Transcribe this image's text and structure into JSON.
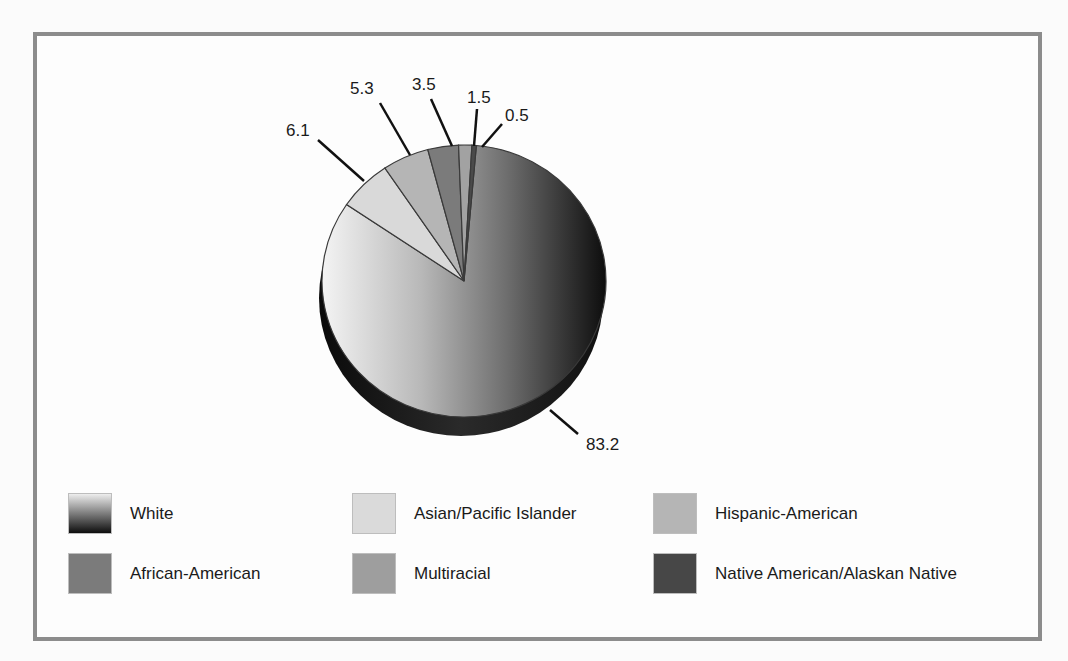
{
  "chart_data": {
    "type": "pie",
    "title": "",
    "style": "3d-tilted pie with leader-line labels, grayscale",
    "start_angle_deg": 5,
    "direction": "clockwise",
    "slices": [
      {
        "name": "White",
        "value": 83.2,
        "label": "83.2",
        "color": "gradient:#f2f2f2->#0d0d0d"
      },
      {
        "name": "Asian/Pacific Islander",
        "value": 6.1,
        "label": "6.1",
        "color": "#d9d9d9"
      },
      {
        "name": "Hispanic-American",
        "value": 5.3,
        "label": "5.3",
        "color": "#b5b5b5"
      },
      {
        "name": "African-American",
        "value": 3.5,
        "label": "3.5",
        "color": "#7b7b7b"
      },
      {
        "name": "Multiracial",
        "value": 1.5,
        "label": "1.5",
        "color": "#a2a2a2"
      },
      {
        "name": "Native American/Alaskan Native",
        "value": 0.5,
        "label": "0.5",
        "color": "#4a4a4a"
      }
    ],
    "legend_position": "bottom",
    "legend": [
      "White",
      "Asian/Pacific Islander",
      "Hispanic-American",
      "African-American",
      "Multiracial",
      "Native American/Alaskan Native"
    ]
  },
  "labels": {
    "white": "83.2",
    "asian": "6.1",
    "hispanic": "5.3",
    "african": "3.5",
    "multiracial": "1.5",
    "native": "0.5"
  },
  "legend": {
    "white": "White",
    "asian": "Asian/Pacific Islander",
    "hispanic": "Hispanic-American",
    "african": "African-American",
    "multiracial": "Multiracial",
    "native": "Native American/Alaskan Native"
  }
}
